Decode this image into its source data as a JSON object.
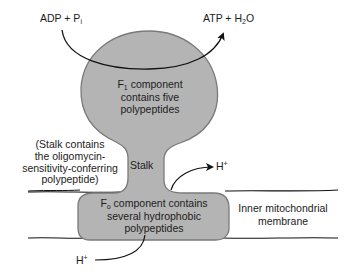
{
  "diagram": {
    "colors": {
      "complex_fill": "#b4b4b4",
      "complex_outline": "#7a7a7a",
      "lines": "#111111",
      "text": "#1c1c1c",
      "background": "#ffffff"
    },
    "reaction": {
      "substrate": {
        "main": "ADP + P",
        "subscript": "i"
      },
      "product": {
        "main": "ATP + H",
        "subscript": "2",
        "tail": "O"
      }
    },
    "f1": {
      "name_main": "F",
      "name_sub": "1",
      "line1_rest": " component",
      "line2": "contains five",
      "line3": "polypeptides"
    },
    "stalk": {
      "label": "Stalk",
      "note_lines": [
        "(Stalk contains",
        "the oligomycin-",
        "sensitivity-conferring",
        "polypeptide)"
      ]
    },
    "f0": {
      "name_main": "F",
      "name_sub": "o",
      "line1_rest": " component contains",
      "line2": "several hydrophobic",
      "line3": "polypeptides"
    },
    "protons": {
      "out": {
        "main": "H",
        "sup": "+"
      },
      "in": {
        "main": "H",
        "sup": "+"
      }
    },
    "membrane": {
      "line1": "Inner mitochondrial",
      "line2": "membrane"
    }
  }
}
